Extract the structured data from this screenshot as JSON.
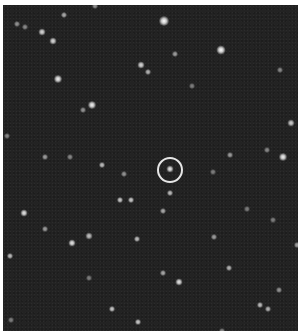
{
  "image": {
    "subject": "star field",
    "background_color": "#232323",
    "border_color": "#ffffff",
    "target_marker": {
      "shape": "circle",
      "cx": 170,
      "cy": 170,
      "r": 13,
      "color": "#e6e6e6"
    }
  },
  "stars": [
    {
      "x": 164,
      "y": 21,
      "size": 7,
      "brightness": 1.0
    },
    {
      "x": 221,
      "y": 50,
      "size": 6,
      "brightness": 1.0
    },
    {
      "x": 58,
      "y": 79,
      "size": 5,
      "brightness": 0.95
    },
    {
      "x": 92,
      "y": 105,
      "size": 5,
      "brightness": 0.95
    },
    {
      "x": 283,
      "y": 157,
      "size": 5,
      "brightness": 0.95
    },
    {
      "x": 42,
      "y": 32,
      "size": 4,
      "brightness": 0.85
    },
    {
      "x": 53,
      "y": 41,
      "size": 4,
      "brightness": 0.85
    },
    {
      "x": 141,
      "y": 65,
      "size": 4,
      "brightness": 0.85
    },
    {
      "x": 148,
      "y": 72,
      "size": 3,
      "brightness": 0.7
    },
    {
      "x": 175,
      "y": 54,
      "size": 3,
      "brightness": 0.6
    },
    {
      "x": 291,
      "y": 123,
      "size": 4,
      "brightness": 0.8
    },
    {
      "x": 24,
      "y": 213,
      "size": 4,
      "brightness": 0.9
    },
    {
      "x": 72,
      "y": 243,
      "size": 4,
      "brightness": 0.9
    },
    {
      "x": 89,
      "y": 236,
      "size": 4,
      "brightness": 0.75
    },
    {
      "x": 170,
      "y": 169,
      "size": 4,
      "brightness": 0.9
    },
    {
      "x": 170,
      "y": 193,
      "size": 3,
      "brightness": 0.75
    },
    {
      "x": 120,
      "y": 200,
      "size": 3,
      "brightness": 0.8
    },
    {
      "x": 131,
      "y": 200,
      "size": 3,
      "brightness": 0.8
    },
    {
      "x": 163,
      "y": 211,
      "size": 3,
      "brightness": 0.65
    },
    {
      "x": 179,
      "y": 282,
      "size": 4,
      "brightness": 0.9
    },
    {
      "x": 137,
      "y": 239,
      "size": 3,
      "brightness": 0.75
    },
    {
      "x": 112,
      "y": 309,
      "size": 3,
      "brightness": 0.8
    },
    {
      "x": 138,
      "y": 322,
      "size": 3,
      "brightness": 0.8
    },
    {
      "x": 260,
      "y": 305,
      "size": 3,
      "brightness": 0.75
    },
    {
      "x": 268,
      "y": 309,
      "size": 3,
      "brightness": 0.7
    },
    {
      "x": 10,
      "y": 256,
      "size": 3,
      "brightness": 0.75
    },
    {
      "x": 64,
      "y": 15,
      "size": 3,
      "brightness": 0.65
    },
    {
      "x": 230,
      "y": 155,
      "size": 3,
      "brightness": 0.6
    },
    {
      "x": 45,
      "y": 229,
      "size": 3,
      "brightness": 0.6
    },
    {
      "x": 102,
      "y": 165,
      "size": 3,
      "brightness": 0.75
    },
    {
      "x": 124,
      "y": 174,
      "size": 3,
      "brightness": 0.55
    },
    {
      "x": 214,
      "y": 237,
      "size": 3,
      "brightness": 0.6
    },
    {
      "x": 229,
      "y": 268,
      "size": 3,
      "brightness": 0.7
    },
    {
      "x": 279,
      "y": 290,
      "size": 3,
      "brightness": 0.55
    },
    {
      "x": 163,
      "y": 273,
      "size": 3,
      "brightness": 0.65
    },
    {
      "x": 297,
      "y": 245,
      "size": 3,
      "brightness": 0.6
    },
    {
      "x": 280,
      "y": 70,
      "size": 3,
      "brightness": 0.5
    },
    {
      "x": 17,
      "y": 24,
      "size": 3,
      "brightness": 0.55
    },
    {
      "x": 25,
      "y": 27,
      "size": 3,
      "brightness": 0.5
    },
    {
      "x": 7,
      "y": 136,
      "size": 3,
      "brightness": 0.5
    },
    {
      "x": 45,
      "y": 157,
      "size": 3,
      "brightness": 0.6
    },
    {
      "x": 70,
      "y": 157,
      "size": 3,
      "brightness": 0.5
    },
    {
      "x": 83,
      "y": 110,
      "size": 3,
      "brightness": 0.55
    },
    {
      "x": 192,
      "y": 86,
      "size": 3,
      "brightness": 0.45
    },
    {
      "x": 267,
      "y": 150,
      "size": 3,
      "brightness": 0.5
    },
    {
      "x": 213,
      "y": 172,
      "size": 3,
      "brightness": 0.45
    },
    {
      "x": 247,
      "y": 209,
      "size": 3,
      "brightness": 0.45
    },
    {
      "x": 273,
      "y": 220,
      "size": 3,
      "brightness": 0.45
    },
    {
      "x": 89,
      "y": 278,
      "size": 3,
      "brightness": 0.45
    },
    {
      "x": 11,
      "y": 320,
      "size": 3,
      "brightness": 0.45
    },
    {
      "x": 95,
      "y": 6,
      "size": 3,
      "brightness": 0.55
    },
    {
      "x": 222,
      "y": 331,
      "size": 3,
      "brightness": 0.5
    }
  ]
}
